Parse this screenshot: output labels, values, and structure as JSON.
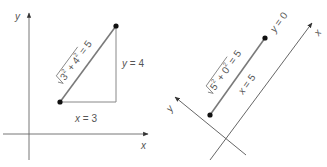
{
  "left_panel": {
    "axis_x_label": "x",
    "axis_y_label": "y",
    "hypotenuse": {
      "radicand_a": "3",
      "radicand_b": "4",
      "exp": "2",
      "plus": "+",
      "equals": "= 5"
    },
    "vertical_leg_label": "y = 4",
    "horizontal_leg_label": "x = 3"
  },
  "right_panel": {
    "axis_x_label": "x",
    "axis_y_label": "y",
    "segment": {
      "radicand_a": "5",
      "radicand_b": "0",
      "exp": "2",
      "plus": "+",
      "equals": "= 5"
    },
    "y_label": "y = 0",
    "x_label": "x = 5"
  },
  "colors": {
    "axis": "#555555",
    "segment": "#7a7a7a",
    "point": "#111111",
    "text": "#555555"
  }
}
